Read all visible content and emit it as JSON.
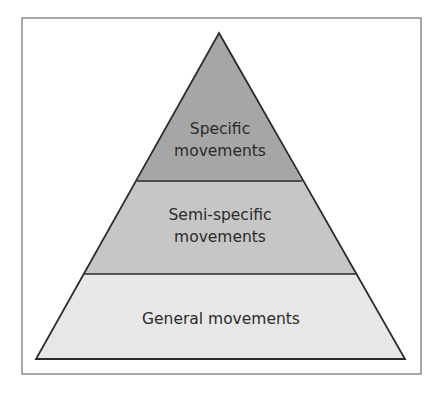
{
  "diagram": {
    "type": "pyramid",
    "tiers": [
      {
        "level": "top",
        "lines": [
          "Specific",
          "movements"
        ],
        "fill": "#a6a6a6"
      },
      {
        "level": "middle",
        "lines": [
          "Semi-specific",
          "movements"
        ],
        "fill": "#c6c6c6"
      },
      {
        "level": "bottom",
        "lines": [
          "General movements"
        ],
        "fill": "#e7e7e7"
      }
    ],
    "colors": {
      "outline": "#2a2a2a",
      "frame": "#6e6e6e",
      "background": "#ffffff",
      "text": "#2b2b2b"
    }
  }
}
